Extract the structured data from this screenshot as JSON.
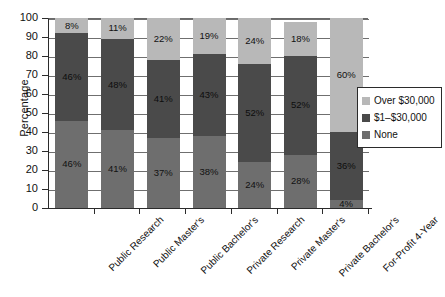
{
  "chart_data": {
    "type": "bar",
    "subtype": "stacked-bar-100",
    "title": "",
    "xlabel": "",
    "ylabel": "Percentage",
    "ylim": [
      0,
      100
    ],
    "ytick_step": 10,
    "ytick_labels": [
      "0",
      "10",
      "20",
      "30",
      "40",
      "50",
      "60",
      "70",
      "80",
      "90",
      "100"
    ],
    "grid": true,
    "legend_position": "right",
    "categories": [
      "Public Research",
      "Public Master's",
      "Public Bachelor's",
      "Private Research",
      "Private Master's",
      "Private Bachelor's",
      "For-Profit 4-Year"
    ],
    "series": [
      {
        "name": "None",
        "color": "#6e6e6e",
        "values": [
          46,
          41,
          37,
          38,
          24,
          28,
          4
        ],
        "labels": [
          "46%",
          "41%",
          "37%",
          "38%",
          "24%",
          "28%",
          "4%"
        ]
      },
      {
        "name": "$1–$30,000",
        "color": "#4a4a4a",
        "values": [
          46,
          48,
          41,
          43,
          52,
          52,
          36
        ],
        "labels": [
          "46%",
          "48%",
          "41%",
          "43%",
          "52%",
          "52%",
          "36%"
        ]
      },
      {
        "name": "Over $30,000",
        "color": "#b8b8b8",
        "values": [
          8,
          11,
          22,
          19,
          24,
          18,
          60
        ],
        "labels": [
          "8%",
          "11%",
          "22%",
          "19%",
          "24%",
          "18%",
          "60%"
        ]
      }
    ],
    "legend": [
      {
        "label": "Over $30,000",
        "color": "#b8b8b8"
      },
      {
        "label": "$1–$30,000",
        "color": "#4a4a4a"
      },
      {
        "label": "None",
        "color": "#6e6e6e"
      }
    ]
  }
}
